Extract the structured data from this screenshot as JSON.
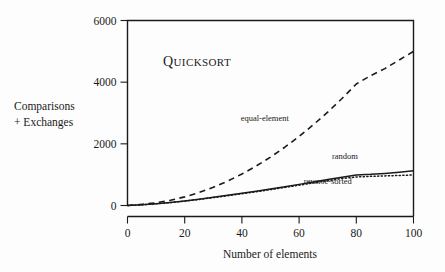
{
  "chart_data": {
    "type": "line",
    "title": "QUICKSORT",
    "xlabel": "Number of elements",
    "ylabel_line1": "Comparisons",
    "ylabel_line2": "+ Exchanges",
    "xlim": [
      0,
      100
    ],
    "ylim": [
      0,
      6000
    ],
    "xticks": [
      0,
      20,
      40,
      60,
      80,
      100
    ],
    "yticks": [
      0,
      2000,
      4000,
      6000
    ],
    "xtick_labels": [
      "0",
      "20",
      "40",
      "60",
      "80",
      "100"
    ],
    "ytick_labels": [
      "0",
      "2000",
      "4000",
      "6000"
    ],
    "grid": false,
    "legend_position": "inline-annotations",
    "series": [
      {
        "name": "equal-element",
        "style": "dashed",
        "label": "equal-element",
        "label_x": 48,
        "label_y": 2750,
        "x": [
          0,
          5,
          10,
          15,
          20,
          25,
          30,
          35,
          40,
          45,
          50,
          55,
          60,
          65,
          70,
          75,
          80,
          85,
          90,
          95,
          100
        ],
        "y": [
          0,
          35,
          90,
          170,
          280,
          420,
          590,
          790,
          1020,
          1280,
          1570,
          1890,
          2240,
          2620,
          3030,
          3470,
          3940,
          4210,
          4440,
          4720,
          5000
        ]
      },
      {
        "name": "random",
        "style": "solid",
        "label": "random",
        "label_x": 76,
        "label_y": 1520,
        "x": [
          0,
          5,
          10,
          15,
          20,
          25,
          30,
          35,
          40,
          45,
          50,
          55,
          60,
          65,
          70,
          75,
          80,
          85,
          90,
          95,
          100
        ],
        "y": [
          0,
          25,
          60,
          100,
          150,
          205,
          265,
          330,
          395,
          465,
          535,
          610,
          685,
          760,
          840,
          915,
          990,
          1010,
          1040,
          1080,
          1130
        ]
      },
      {
        "name": "reverse-sorted",
        "style": "dotted",
        "label": "reverse-sorted",
        "label_x": 70,
        "label_y": 690,
        "x": [
          0,
          5,
          10,
          15,
          20,
          25,
          30,
          35,
          40,
          45,
          50,
          55,
          60,
          65,
          70,
          75,
          80,
          85,
          90,
          95,
          100
        ],
        "y": [
          0,
          24,
          57,
          96,
          144,
          197,
          255,
          318,
          381,
          448,
          515,
          586,
          658,
          730,
          805,
          875,
          925,
          945,
          960,
          975,
          990
        ]
      }
    ]
  }
}
